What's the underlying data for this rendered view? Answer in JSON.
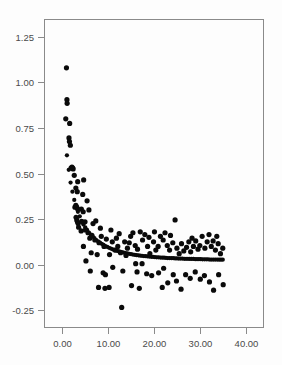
{
  "figure": {
    "background_color": "#fdfdfd",
    "plot_area": {
      "left_px": 44,
      "right_px": 264,
      "top_px": 19,
      "bottom_px": 328,
      "border_color": "#8a8a8a"
    },
    "point_color": "#0a0a0a",
    "point_radius_px": 2.6
  },
  "chart_data": {
    "type": "scatter",
    "title": "",
    "subtitle": "",
    "xlabel": "",
    "ylabel": "",
    "xlim": [
      -4.0,
      44.0
    ],
    "ylim": [
      -0.3478,
      1.3478
    ],
    "grid": false,
    "legend": null,
    "xticks": [
      0.0,
      10.0,
      20.0,
      30.0,
      40.0
    ],
    "xticklabels": [
      "0.00",
      "10.00",
      "20.00",
      "30.00",
      "40.00"
    ],
    "yticks": [
      -0.25,
      0.0,
      0.25,
      0.5,
      0.75,
      1.0,
      1.25
    ],
    "yticklabels": [
      "-0.25",
      "0.00",
      "0.25",
      "0.50",
      "0.75",
      "1.00",
      "1.25"
    ],
    "series": [
      {
        "name": "observed",
        "marker": "circle",
        "color": "#0a0a0a",
        "points": [
          [
            0.9,
            1.08
          ],
          [
            1.0,
            0.905
          ],
          [
            1.05,
            0.885
          ],
          [
            0.75,
            0.8
          ],
          [
            1.6,
            0.775
          ],
          [
            1.45,
            0.695
          ],
          [
            1.55,
            0.675
          ],
          [
            1.75,
            0.655
          ],
          [
            1.9,
            0.53
          ],
          [
            2.1,
            0.535
          ],
          [
            2.25,
            0.53
          ],
          [
            2.35,
            0.525
          ],
          [
            2.6,
            0.49
          ],
          [
            3.35,
            0.455
          ],
          [
            2.95,
            0.42
          ],
          [
            4.65,
            0.465
          ],
          [
            3.25,
            0.4
          ],
          [
            4.45,
            0.385
          ],
          [
            2.75,
            0.315
          ],
          [
            2.95,
            0.325
          ],
          [
            3.15,
            0.315
          ],
          [
            3.35,
            0.305
          ],
          [
            4.15,
            0.305
          ],
          [
            5.4,
            0.35
          ],
          [
            4.55,
            0.29
          ],
          [
            3.0,
            0.26
          ],
          [
            3.15,
            0.245
          ],
          [
            3.3,
            0.235
          ],
          [
            3.45,
            0.225
          ],
          [
            4.35,
            0.235
          ],
          [
            4.95,
            0.235
          ],
          [
            3.55,
            0.205
          ],
          [
            4.1,
            0.185
          ],
          [
            5.0,
            0.19
          ],
          [
            5.6,
            0.175
          ],
          [
            4.6,
            0.1
          ],
          [
            6.0,
            0.145
          ],
          [
            6.45,
            0.16
          ],
          [
            5.15,
            0.02
          ],
          [
            7.1,
            0.135
          ],
          [
            6.3,
            0.065
          ],
          [
            7.6,
            0.055
          ],
          [
            8.5,
            0.155
          ],
          [
            8.0,
            0.12
          ],
          [
            6.1,
            -0.035
          ],
          [
            9.1,
            0.1
          ],
          [
            9.6,
            0.14
          ],
          [
            10.3,
            0.055
          ],
          [
            8.9,
            -0.045
          ],
          [
            10.9,
            0.125
          ],
          [
            11.5,
            0.08
          ],
          [
            9.4,
            -0.055
          ],
          [
            11.0,
            -0.015
          ],
          [
            7.9,
            -0.125
          ],
          [
            12.1,
            0.1
          ],
          [
            12.7,
            0.065
          ],
          [
            12.95,
            -0.235
          ],
          [
            9.3,
            -0.13
          ],
          [
            13.6,
            0.125
          ],
          [
            14.2,
            0.09
          ],
          [
            13.2,
            -0.035
          ],
          [
            14.9,
            0.155
          ],
          [
            15.4,
            0.175
          ],
          [
            10.2,
            -0.125
          ],
          [
            15.9,
            0.105
          ],
          [
            16.4,
            0.085
          ],
          [
            16.0,
            0.005
          ],
          [
            17.0,
            0.18
          ],
          [
            16.3,
            -0.04
          ],
          [
            17.5,
            0.135
          ],
          [
            18.0,
            0.165
          ],
          [
            17.4,
            0.005
          ],
          [
            18.6,
            0.1
          ],
          [
            19.1,
            0.06
          ],
          [
            18.4,
            -0.05
          ],
          [
            19.9,
            0.125
          ],
          [
            20.4,
            0.08
          ],
          [
            19.5,
            -0.06
          ],
          [
            20.9,
            0.1
          ],
          [
            21.4,
            0.155
          ],
          [
            21.0,
            -0.045
          ],
          [
            22.0,
            0.135
          ],
          [
            22.4,
            0.175
          ],
          [
            22.1,
            -0.02
          ],
          [
            22.9,
            0.105
          ],
          [
            23.4,
            0.08
          ],
          [
            23.0,
            -0.1
          ],
          [
            21.8,
            -0.125
          ],
          [
            24.1,
            0.12
          ],
          [
            24.6,
            0.245
          ],
          [
            24.2,
            -0.055
          ],
          [
            25.0,
            0.09
          ],
          [
            25.5,
            0.06
          ],
          [
            24.9,
            -0.09
          ],
          [
            26.0,
            0.115
          ],
          [
            26.5,
            0.075
          ],
          [
            25.9,
            -0.135
          ],
          [
            27.1,
            0.095
          ],
          [
            27.6,
            0.125
          ],
          [
            26.9,
            -0.055
          ],
          [
            28.0,
            0.07
          ],
          [
            28.6,
            0.1
          ],
          [
            27.9,
            -0.075
          ],
          [
            29.1,
            0.13
          ],
          [
            29.6,
            0.085
          ],
          [
            29.0,
            -0.04
          ],
          [
            30.0,
            0.105
          ],
          [
            30.5,
            0.155
          ],
          [
            30.1,
            -0.08
          ],
          [
            31.1,
            0.09
          ],
          [
            31.6,
            0.125
          ],
          [
            31.0,
            -0.06
          ],
          [
            32.0,
            0.165
          ],
          [
            32.5,
            0.1
          ],
          [
            32.1,
            -0.095
          ],
          [
            32.9,
            0.13
          ],
          [
            33.4,
            0.08
          ],
          [
            33.0,
            -0.14
          ],
          [
            34.0,
            0.115
          ],
          [
            34.5,
            0.06
          ],
          [
            34.1,
            -0.055
          ],
          [
            35.0,
            0.09
          ],
          [
            35.1,
            -0.11
          ],
          [
            12.4,
            0.17
          ],
          [
            11.8,
            0.145
          ],
          [
            13.9,
            0.05
          ],
          [
            15.1,
            -0.115
          ],
          [
            16.8,
            -0.13
          ],
          [
            20.1,
            0.18
          ],
          [
            23.6,
            0.16
          ],
          [
            28.3,
            0.145
          ],
          [
            33.7,
            0.155
          ],
          [
            7.3,
            0.24
          ],
          [
            6.7,
            0.225
          ],
          [
            5.8,
            0.3
          ],
          [
            8.3,
            0.2
          ],
          [
            10.6,
            0.19
          ],
          [
            14.6,
            0.12
          ],
          [
            18.9,
            0.15
          ]
        ]
      },
      {
        "name": "fitted",
        "marker": "circle",
        "color": "#0a0a0a",
        "comment": "dense near-continuous decaying curve of fitted values",
        "points": [
          [
            1.0,
            0.6
          ],
          [
            1.4,
            0.52
          ],
          [
            1.8,
            0.45
          ],
          [
            2.2,
            0.4
          ],
          [
            2.6,
            0.355
          ],
          [
            3.0,
            0.32
          ],
          [
            3.4,
            0.29
          ],
          [
            3.8,
            0.265
          ],
          [
            4.2,
            0.24
          ],
          [
            4.6,
            0.22
          ],
          [
            5.0,
            0.205
          ],
          [
            5.4,
            0.19
          ],
          [
            5.8,
            0.175
          ],
          [
            6.2,
            0.165
          ],
          [
            6.6,
            0.155
          ],
          [
            7.0,
            0.145
          ],
          [
            7.4,
            0.135
          ],
          [
            7.8,
            0.128
          ],
          [
            8.2,
            0.12
          ],
          [
            8.6,
            0.114
          ],
          [
            9.0,
            0.108
          ],
          [
            9.4,
            0.102
          ],
          [
            9.8,
            0.097
          ],
          [
            10.2,
            0.092
          ],
          [
            10.6,
            0.088
          ],
          [
            11.0,
            0.084
          ],
          [
            11.4,
            0.08
          ],
          [
            11.8,
            0.077
          ],
          [
            12.2,
            0.074
          ],
          [
            12.6,
            0.071
          ],
          [
            13.0,
            0.068
          ],
          [
            13.4,
            0.066
          ],
          [
            13.8,
            0.063
          ],
          [
            14.2,
            0.061
          ],
          [
            14.6,
            0.059
          ],
          [
            15.0,
            0.057
          ],
          [
            15.4,
            0.055
          ],
          [
            15.8,
            0.054
          ],
          [
            16.2,
            0.052
          ],
          [
            16.6,
            0.051
          ],
          [
            17.0,
            0.049
          ],
          [
            17.4,
            0.048
          ],
          [
            17.8,
            0.047
          ],
          [
            18.2,
            0.046
          ],
          [
            18.6,
            0.045
          ],
          [
            19.0,
            0.044
          ],
          [
            19.4,
            0.043
          ],
          [
            19.8,
            0.042
          ],
          [
            20.2,
            0.041
          ],
          [
            20.6,
            0.04
          ],
          [
            21.0,
            0.04
          ],
          [
            21.4,
            0.039
          ],
          [
            21.8,
            0.038
          ],
          [
            22.2,
            0.038
          ],
          [
            22.6,
            0.037
          ],
          [
            23.0,
            0.036
          ],
          [
            23.4,
            0.036
          ],
          [
            23.8,
            0.035
          ],
          [
            24.2,
            0.035
          ],
          [
            24.6,
            0.034
          ],
          [
            25.0,
            0.034
          ],
          [
            25.4,
            0.033
          ],
          [
            25.8,
            0.033
          ],
          [
            26.2,
            0.033
          ],
          [
            26.6,
            0.032
          ],
          [
            27.0,
            0.032
          ],
          [
            27.4,
            0.032
          ],
          [
            27.8,
            0.031
          ],
          [
            28.2,
            0.031
          ],
          [
            28.6,
            0.031
          ],
          [
            29.0,
            0.03
          ],
          [
            29.4,
            0.03
          ],
          [
            29.8,
            0.03
          ],
          [
            30.2,
            0.03
          ],
          [
            30.6,
            0.029
          ],
          [
            31.0,
            0.029
          ],
          [
            31.4,
            0.029
          ],
          [
            31.8,
            0.029
          ],
          [
            32.2,
            0.028
          ],
          [
            32.6,
            0.028
          ],
          [
            33.0,
            0.028
          ],
          [
            33.4,
            0.028
          ],
          [
            33.8,
            0.028
          ],
          [
            34.2,
            0.027
          ],
          [
            34.6,
            0.027
          ],
          [
            35.0,
            0.027
          ]
        ]
      }
    ]
  }
}
